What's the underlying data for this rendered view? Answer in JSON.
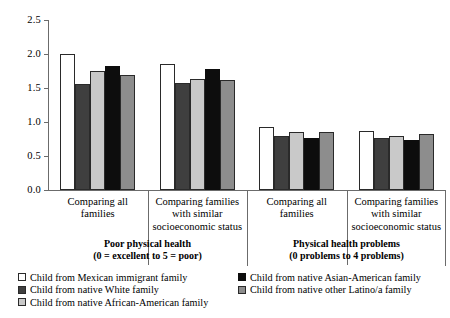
{
  "chart_data": {
    "type": "bar",
    "title": "",
    "xlabel": "",
    "ylabel": "",
    "ylim": [
      0.0,
      2.5
    ],
    "ytick_labels": [
      "2.5",
      "2.0",
      "1.5",
      "1.0",
      "0.5",
      "0.0"
    ],
    "ytick_values": [
      2.5,
      2.0,
      1.5,
      1.0,
      0.5,
      0.0
    ],
    "grid": false,
    "legend_position": "bottom",
    "categories": [
      "Comparing all families",
      "Comparing families with similar socioeconomic status",
      "Comparing all families",
      "Comparing families with similar socioeconomic status"
    ],
    "series": [
      {
        "name": "Child from Mexican immigrant family",
        "color": "#ffffff",
        "values": [
          2.0,
          1.85,
          0.93,
          0.87
        ]
      },
      {
        "name": "Child from native White family",
        "color": "#3f3f3f",
        "values": [
          1.56,
          1.57,
          0.8,
          0.76
        ]
      },
      {
        "name": "Child from native African-American family",
        "color": "#c9c9c9",
        "values": [
          1.75,
          1.63,
          0.85,
          0.79
        ]
      },
      {
        "name": "Child from native Asian-American family",
        "color": "#0d0d0d",
        "values": [
          1.82,
          1.78,
          0.77,
          0.74
        ]
      },
      {
        "name": "Child from native other Latino/a family",
        "color": "#8d8d8d",
        "values": [
          1.69,
          1.62,
          0.85,
          0.82
        ]
      }
    ],
    "panels": [
      {
        "title": "Poor physical health",
        "scale_note": "(0 = excellent to 5 = poor)"
      },
      {
        "title": "Physical health problems",
        "scale_note": "(0 problems to 4 problems)"
      }
    ]
  },
  "axis": {
    "ticks": [
      {
        "label": "2.5"
      },
      {
        "label": "2.0"
      },
      {
        "label": "1.5"
      },
      {
        "label": "1.0"
      },
      {
        "label": "0.5"
      },
      {
        "label": "0.0"
      }
    ]
  },
  "subgroups": [
    {
      "line1": "Comparing all",
      "line2": "families",
      "line3": ""
    },
    {
      "line1": "Comparing families",
      "line2": "with similar",
      "line3": "socioeconomic status"
    },
    {
      "line1": "Comparing all",
      "line2": "families",
      "line3": ""
    },
    {
      "line1": "Comparing families",
      "line2": "with similar",
      "line3": "socioeconomic status"
    }
  ],
  "groups": [
    {
      "title": "Poor physical health",
      "note": "(0 = excellent to 5 = poor)"
    },
    {
      "title": "Physical health problems",
      "note": "(0 problems to 4 problems)"
    }
  ],
  "legend": {
    "column_a": [
      {
        "label": "Child from Mexican immigrant family",
        "swatch": "sw-white"
      },
      {
        "label": "Child from native White family",
        "swatch": "sw-dark"
      },
      {
        "label": "Child from native African-American family",
        "swatch": "sw-light"
      }
    ],
    "column_b": [
      {
        "label": "Child from native Asian-American family",
        "swatch": "sw-black"
      },
      {
        "label": "Child from native other Latino/a family",
        "swatch": "sw-medium"
      }
    ]
  }
}
